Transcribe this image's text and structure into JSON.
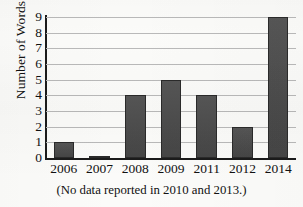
{
  "chart_data": {
    "type": "bar",
    "title": "",
    "subtitle": "",
    "xlabel": "",
    "ylabel": "Number of Words",
    "categories": [
      "2006",
      "2007",
      "2008",
      "2009",
      "2011",
      "2012",
      "2014"
    ],
    "values": [
      1,
      0,
      4,
      5,
      4,
      2,
      9
    ],
    "ylim": [
      0,
      9
    ],
    "ytick_labels": [
      "0",
      "1",
      "2",
      "3",
      "4",
      "5",
      "6",
      "7",
      "8",
      "9"
    ],
    "ytick_values": [
      0,
      1,
      2,
      3,
      4,
      5,
      6,
      7,
      8,
      9
    ],
    "grid": "horizontal",
    "legend": "none",
    "annotation": "(No data reported in 2010 and 2013.)",
    "series": [
      {
        "name": "Number of Words",
        "values": [
          1,
          0,
          4,
          5,
          4,
          2,
          9
        ]
      }
    ],
    "colors": {
      "bar_fill": "#4b4b4b",
      "bar_stroke": "#2a2a2a",
      "gridline": "#b9b9b9",
      "axis": "#1b1b1b",
      "background": "#fbfbf9",
      "text": "#111111"
    }
  }
}
